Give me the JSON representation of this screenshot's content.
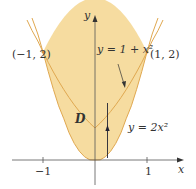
{
  "figure": {
    "axis_x_label": "x",
    "axis_y_label": "y",
    "tick_neg1": "−1",
    "tick_pos1": "1",
    "point_left": "(−1, 2)",
    "point_right": "(1, 2)",
    "curve_upper_label": "y = 1 + x²",
    "curve_lower_label": "y = 2x²",
    "region_label": "D",
    "colors": {
      "fill": "#f6dca0",
      "curve": "#e0a850",
      "axis": "#555555"
    }
  }
}
